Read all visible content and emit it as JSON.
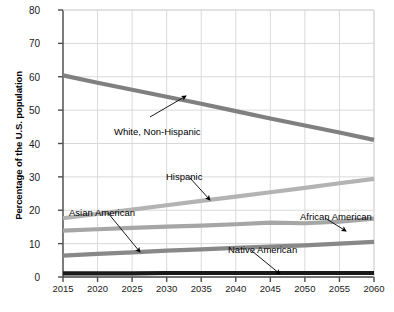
{
  "chart_data": {
    "type": "line",
    "title": "",
    "xlabel": "",
    "ylabel": "Percentage of the U.S. population",
    "x": [
      2015,
      2020,
      2025,
      2030,
      2035,
      2040,
      2045,
      2050,
      2055,
      2060
    ],
    "xticklabels": [
      "2015",
      "2020",
      "2025",
      "2030",
      "2035",
      "2040",
      "2045",
      "2050",
      "2055",
      "2060"
    ],
    "yticklabels": [
      "0",
      "10",
      "20",
      "30",
      "40",
      "50",
      "60",
      "70",
      "80"
    ],
    "yticks": [
      0,
      10,
      20,
      30,
      40,
      50,
      60,
      70,
      80
    ],
    "ylim": [
      0,
      80
    ],
    "xlim": [
      2015,
      2060
    ],
    "grid": true,
    "legend": "inline-annotations",
    "series": [
      {
        "name": "White, Non-Hispanic",
        "color": "#808080",
        "values": [
          60.4,
          58.2,
          56.1,
          54.0,
          51.9,
          49.7,
          47.5,
          45.4,
          43.3,
          41.1
        ]
      },
      {
        "name": "Hispanic",
        "color": "#b3b3b3",
        "values": [
          17.6,
          18.9,
          20.2,
          21.5,
          22.8,
          24.1,
          25.4,
          26.7,
          28.1,
          29.4
        ]
      },
      {
        "name": "African American",
        "color": "#a6a6a6",
        "values": [
          13.9,
          14.3,
          14.7,
          15.1,
          15.4,
          15.8,
          16.3,
          16.1,
          16.6,
          17.5
        ]
      },
      {
        "name": "Asian American",
        "color": "#888888",
        "values": [
          6.4,
          6.9,
          7.4,
          7.9,
          8.3,
          8.7,
          9.1,
          9.5,
          10.0,
          10.5
        ]
      },
      {
        "name": "Native American",
        "color": "#1a1a1a",
        "values": [
          1.1,
          1.1,
          1.1,
          1.2,
          1.2,
          1.2,
          1.2,
          1.2,
          1.2,
          1.2
        ]
      }
    ],
    "annotations": [
      {
        "label": "White, Non-Hispanic",
        "series": "White, Non-Hispanic",
        "text_x": 114,
        "text_y": 126,
        "arrow_from_x": 150,
        "arrow_from_y": 117,
        "arrow_to_x": 186,
        "arrow_to_y": 96
      },
      {
        "label": "Hispanic",
        "series": "Hispanic",
        "text_x": 166,
        "text_y": 171,
        "arrow_from_x": 190,
        "arrow_from_y": 178,
        "arrow_to_x": 210,
        "arrow_to_y": 200
      },
      {
        "label": "Asian American",
        "series": "Asian American",
        "text_x": 69,
        "text_y": 207,
        "arrow_from_x": 108,
        "arrow_from_y": 213,
        "arrow_to_x": 140,
        "arrow_to_y": 252
      },
      {
        "label": "African American",
        "series": "African American",
        "text_x": 300,
        "text_y": 211,
        "arrow_from_x": 325,
        "arrow_from_y": 218,
        "arrow_to_x": 346,
        "arrow_to_y": 231
      },
      {
        "label": "Native American",
        "series": "Native American",
        "text_x": 228,
        "text_y": 244,
        "arrow_from_x": 252,
        "arrow_from_y": 251,
        "arrow_to_x": 280,
        "arrow_to_y": 274
      }
    ]
  },
  "axis": {
    "ylabel": "Percentage of the U.S. population"
  }
}
